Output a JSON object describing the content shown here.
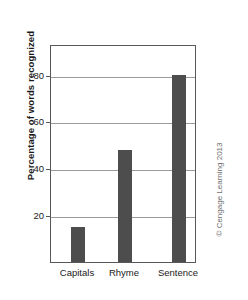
{
  "chart_data": {
    "type": "bar",
    "title": "",
    "subtitle": "",
    "categories": [
      "Capitals",
      "Rhyme",
      "Sentence"
    ],
    "values": [
      15,
      48,
      80
    ],
    "xlabel": "",
    "ylabel": "Percentage of words recognized",
    "ylim": [
      0,
      93
    ],
    "yticks": [
      20,
      40,
      60,
      80
    ],
    "ytick_labels": [
      "20",
      "40",
      "60",
      "80"
    ],
    "grid": true,
    "grid_axis": "y",
    "legend": false,
    "legend_position": "none",
    "bar_color": "#4d4d4d",
    "frame_color": "#58585a",
    "gridline_color": "#9a9a9c",
    "background": "#ffffff",
    "annotations": []
  },
  "credit": {
    "text": "© Cengage Learning 2013"
  }
}
